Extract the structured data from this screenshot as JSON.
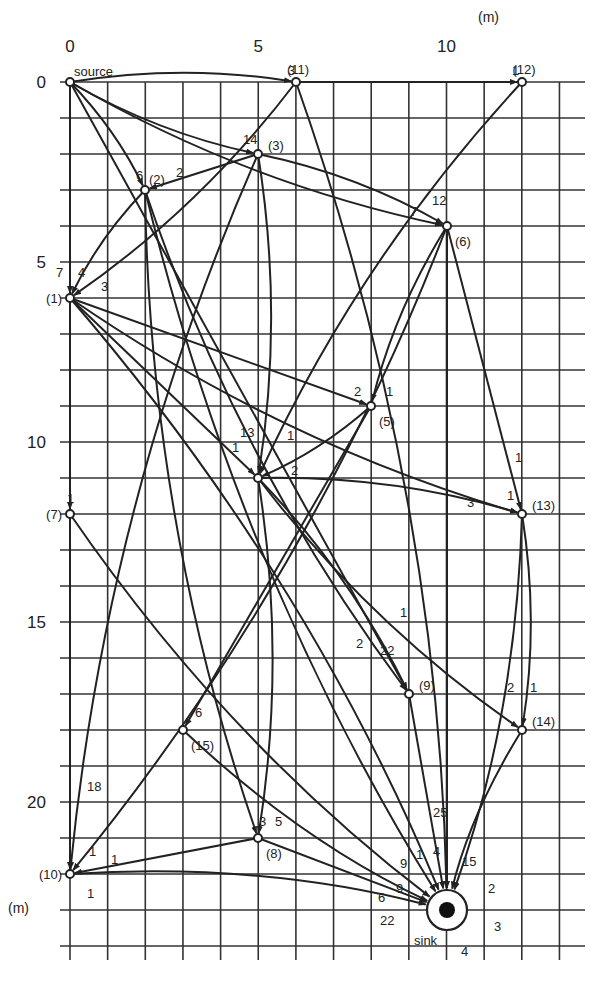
{
  "figure": {
    "unit_x": "(m)",
    "unit_y": "(m)",
    "x_ticks": [
      {
        "v": 0,
        "label": "0"
      },
      {
        "v": 5,
        "label": "5"
      },
      {
        "v": 10,
        "label": "10"
      }
    ],
    "y_ticks": [
      {
        "v": 0,
        "label": "0"
      },
      {
        "v": 5,
        "label": "5"
      },
      {
        "v": 10,
        "label": "10"
      },
      {
        "v": 15,
        "label": "15"
      },
      {
        "v": 20,
        "label": "20"
      }
    ],
    "caption_partial": "...each dot represents 100 ... wood ...",
    "source_label": "source",
    "sink_label": "sink"
  },
  "nodes": [
    {
      "id": "source",
      "label": "source",
      "x": 0,
      "y": 0,
      "px": 70,
      "py": 82
    },
    {
      "id": "11",
      "label": "(11)",
      "x": 6,
      "y": 0,
      "px": 296,
      "py": 82
    },
    {
      "id": "12",
      "label": "(12)",
      "x": 12,
      "y": 0,
      "px": 522,
      "py": 82
    },
    {
      "id": "3",
      "label": "(3)",
      "x": 5,
      "y": 2,
      "px": 258,
      "py": 154
    },
    {
      "id": "2",
      "label": "(2)",
      "x": 2,
      "y": 3,
      "px": 145,
      "py": 190
    },
    {
      "id": "6",
      "label": "(6)",
      "x": 10,
      "y": 4,
      "px": 447,
      "py": 226
    },
    {
      "id": "1",
      "label": "(1)",
      "x": 0,
      "y": 6,
      "px": 70,
      "py": 298
    },
    {
      "id": "5",
      "label": "(5)",
      "x": 8,
      "y": 9,
      "px": 371,
      "py": 406
    },
    {
      "id": "4",
      "label": "",
      "x": 5,
      "y": 11,
      "px": 258,
      "py": 478
    },
    {
      "id": "7",
      "label": "(7)",
      "x": 0,
      "y": 12,
      "px": 70,
      "py": 514
    },
    {
      "id": "13",
      "label": "(13)",
      "x": 12,
      "y": 12,
      "px": 522,
      "py": 514
    },
    {
      "id": "9",
      "label": "(9)",
      "x": 9,
      "y": 17,
      "px": 409,
      "py": 694
    },
    {
      "id": "14",
      "label": "(14)",
      "x": 12,
      "y": 18,
      "px": 522,
      "py": 730
    },
    {
      "id": "15",
      "label": "(15)",
      "x": 3,
      "y": 18,
      "px": 183,
      "py": 730
    },
    {
      "id": "8",
      "label": "(8)",
      "x": 5,
      "y": 21,
      "px": 258,
      "py": 838
    },
    {
      "id": "10",
      "label": "(10)",
      "x": 0,
      "y": 22,
      "px": 70,
      "py": 874
    },
    {
      "id": "sink",
      "label": "sink",
      "x": 10,
      "y": 23,
      "px": 447,
      "py": 910
    }
  ],
  "edges": [
    {
      "from": "source",
      "to": "11",
      "w": "3"
    },
    {
      "from": "11",
      "to": "12",
      "w": "1"
    },
    {
      "from": "source",
      "to": "3",
      "w": "14"
    },
    {
      "from": "source",
      "to": "2",
      "w": "6"
    },
    {
      "from": "3",
      "to": "2",
      "w": "2"
    },
    {
      "from": "source",
      "to": "6",
      "w": "12"
    },
    {
      "from": "3",
      "to": "6",
      "w": "7"
    },
    {
      "from": "source",
      "to": "1",
      "w": "7"
    },
    {
      "from": "2",
      "to": "1",
      "w": "4"
    },
    {
      "from": "11",
      "to": "1",
      "w": "3"
    },
    {
      "from": "1",
      "to": "5",
      "w": "2"
    },
    {
      "from": "6",
      "to": "5",
      "w": "1"
    },
    {
      "from": "3",
      "to": "4",
      "w": "13"
    },
    {
      "from": "1",
      "to": "4",
      "w": "1"
    },
    {
      "from": "12",
      "to": "4",
      "w": "1"
    },
    {
      "from": "5",
      "to": "4",
      "w": "2"
    },
    {
      "from": "1",
      "to": "7",
      "w": "1"
    },
    {
      "from": "1",
      "to": "13",
      "w": "1"
    },
    {
      "from": "4",
      "to": "13",
      "w": "3"
    },
    {
      "from": "6",
      "to": "13",
      "w": "1"
    },
    {
      "from": "2",
      "to": "9",
      "w": "1"
    },
    {
      "from": "4",
      "to": "9",
      "w": "2"
    },
    {
      "from": "source",
      "to": "9",
      "w": "22"
    },
    {
      "from": "4",
      "to": "14",
      "w": "2"
    },
    {
      "from": "13",
      "to": "14",
      "w": "1"
    },
    {
      "from": "5",
      "to": "15",
      "w": "6"
    },
    {
      "from": "2",
      "to": "8",
      "w": "3"
    },
    {
      "from": "4",
      "to": "8",
      "w": "5"
    },
    {
      "from": "source",
      "to": "10",
      "w": "18"
    },
    {
      "from": "3",
      "to": "10",
      "w": "1"
    },
    {
      "from": "6",
      "to": "10",
      "w": "1"
    },
    {
      "from": "8",
      "to": "10",
      "w": "1"
    },
    {
      "from": "7",
      "to": "sink",
      "w": "1"
    },
    {
      "from": "1",
      "to": "sink",
      "w": "9"
    },
    {
      "from": "8",
      "to": "sink",
      "w": "9"
    },
    {
      "from": "15",
      "to": "sink",
      "w": "6"
    },
    {
      "from": "10",
      "to": "sink",
      "w": "22"
    },
    {
      "from": "9",
      "to": "sink",
      "w": "25"
    },
    {
      "from": "2",
      "to": "sink",
      "w": "4"
    },
    {
      "from": "11",
      "to": "sink",
      "w": "15"
    },
    {
      "from": "6",
      "to": "sink",
      "w": "2"
    },
    {
      "from": "14",
      "to": "sink",
      "w": "3"
    },
    {
      "from": "13",
      "to": "sink",
      "w": "4"
    }
  ],
  "weight_labels": [
    {
      "t": "3",
      "x": 288,
      "y": 75
    },
    {
      "t": "1",
      "x": 512,
      "y": 75
    },
    {
      "t": "14",
      "x": 243,
      "y": 144
    },
    {
      "t": "6",
      "x": 136,
      "y": 180
    },
    {
      "t": "2",
      "x": 176,
      "y": 177
    },
    {
      "t": "12",
      "x": 432,
      "y": 205
    },
    {
      "t": "7",
      "x": 410,
      "y": 216
    },
    {
      "t": "7",
      "x": 56,
      "y": 277
    },
    {
      "t": "4",
      "x": 78,
      "y": 277
    },
    {
      "t": "3",
      "x": 101,
      "y": 291
    },
    {
      "t": "2",
      "x": 354,
      "y": 396
    },
    {
      "t": "1",
      "x": 386,
      "y": 396
    },
    {
      "t": "13",
      "x": 240,
      "y": 437
    },
    {
      "t": "1",
      "x": 287,
      "y": 440
    },
    {
      "t": "1",
      "x": 232,
      "y": 452
    },
    {
      "t": "2",
      "x": 291,
      "y": 475
    },
    {
      "t": "1",
      "x": 67,
      "y": 503
    },
    {
      "t": "1",
      "x": 515,
      "y": 462
    },
    {
      "t": "1",
      "x": 507,
      "y": 500
    },
    {
      "t": "3",
      "x": 467,
      "y": 507
    },
    {
      "t": "1",
      "x": 400,
      "y": 617
    },
    {
      "t": "2",
      "x": 356,
      "y": 648
    },
    {
      "t": "22",
      "x": 380,
      "y": 655
    },
    {
      "t": "2",
      "x": 507,
      "y": 692
    },
    {
      "t": "1",
      "x": 530,
      "y": 692
    },
    {
      "t": "6",
      "x": 195,
      "y": 717
    },
    {
      "t": "18",
      "x": 87,
      "y": 791
    },
    {
      "t": "3",
      "x": 259,
      "y": 826
    },
    {
      "t": "5",
      "x": 275,
      "y": 826
    },
    {
      "t": "1",
      "x": 89,
      "y": 856
    },
    {
      "t": "1",
      "x": 111,
      "y": 864
    },
    {
      "t": "1",
      "x": 87,
      "y": 898
    },
    {
      "t": "25",
      "x": 433,
      "y": 817
    },
    {
      "t": "1",
      "x": 416,
      "y": 859
    },
    {
      "t": "4",
      "x": 433,
      "y": 856
    },
    {
      "t": "9",
      "x": 400,
      "y": 868
    },
    {
      "t": "15",
      "x": 462,
      "y": 866
    },
    {
      "t": "9",
      "x": 396,
      "y": 893
    },
    {
      "t": "2",
      "x": 488,
      "y": 893
    },
    {
      "t": "6",
      "x": 378,
      "y": 902
    },
    {
      "t": "22",
      "x": 380,
      "y": 925
    },
    {
      "t": "3",
      "x": 494,
      "y": 931
    },
    {
      "t": "4",
      "x": 461,
      "y": 956
    }
  ]
}
